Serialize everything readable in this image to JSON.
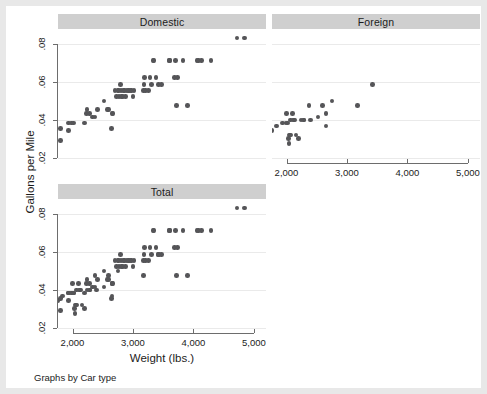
{
  "figure": {
    "background": "#e8e8e8",
    "canvas_color": "#ffffff",
    "strip_color": "#cfcfcf",
    "marker_color": "#555558",
    "grid_color": "#eaeaea",
    "axis_color": "#6d6d6d",
    "note": "Graphs by Car type",
    "ytitle": "Gallons per Mile",
    "xtitle": "Weight (lbs.)"
  },
  "chart_data": {
    "type": "scatter",
    "title": "",
    "xlabel": "Weight (lbs.)",
    "ylabel": "Gallons per Mile",
    "xlim": [
      1760,
      5200
    ],
    "ylim": [
      0.018,
      0.088
    ],
    "xticks": [
      2000,
      3000,
      4000,
      5000
    ],
    "xticklabels": [
      "2,000",
      "3,000",
      "4,000",
      "5,000"
    ],
    "yticks": [
      0.02,
      0.04,
      0.06,
      0.08
    ],
    "yticklabels": [
      ".02",
      ".04",
      ".06",
      ".08"
    ],
    "grid": "horizontal",
    "legend": "none",
    "by_variable": "Car type",
    "panels": [
      {
        "name": "domestic",
        "label": "Domestic",
        "show_xaxis": false,
        "show_yaxis": true,
        "points": [
          [
            1800,
            0.0357
          ],
          [
            1800,
            0.0294
          ],
          [
            1930,
            0.0345
          ],
          [
            1930,
            0.0385
          ],
          [
            1980,
            0.0385
          ],
          [
            2020,
            0.0385
          ],
          [
            2200,
            0.0385
          ],
          [
            2230,
            0.0435
          ],
          [
            2240,
            0.0455
          ],
          [
            2280,
            0.0435
          ],
          [
            2330,
            0.0417
          ],
          [
            2370,
            0.0417
          ],
          [
            2410,
            0.0455
          ],
          [
            2520,
            0.05
          ],
          [
            2580,
            0.0455
          ],
          [
            2600,
            0.0455
          ],
          [
            2640,
            0.0357
          ],
          [
            2650,
            0.0435
          ],
          [
            2670,
            0.0435
          ],
          [
            2700,
            0.0556
          ],
          [
            2730,
            0.0526
          ],
          [
            2750,
            0.0556
          ],
          [
            2760,
            0.0556
          ],
          [
            2770,
            0.0526
          ],
          [
            2790,
            0.0588
          ],
          [
            2800,
            0.0556
          ],
          [
            2810,
            0.0526
          ],
          [
            2830,
            0.0526
          ],
          [
            2840,
            0.0556
          ],
          [
            2860,
            0.0556
          ],
          [
            2880,
            0.0526
          ],
          [
            2900,
            0.0556
          ],
          [
            2930,
            0.0556
          ],
          [
            2950,
            0.0556
          ],
          [
            2980,
            0.0556
          ],
          [
            3000,
            0.0526
          ],
          [
            3020,
            0.0556
          ],
          [
            3170,
            0.0556
          ],
          [
            3180,
            0.0588
          ],
          [
            3190,
            0.0625
          ],
          [
            3210,
            0.0556
          ],
          [
            3260,
            0.0556
          ],
          [
            3280,
            0.0625
          ],
          [
            3310,
            0.0588
          ],
          [
            3330,
            0.0714
          ],
          [
            3350,
            0.0714
          ],
          [
            3380,
            0.0625
          ],
          [
            3420,
            0.0588
          ],
          [
            3470,
            0.0588
          ],
          [
            3600,
            0.0714
          ],
          [
            3600,
            0.0714
          ],
          [
            3690,
            0.0625
          ],
          [
            3700,
            0.0714
          ],
          [
            3720,
            0.0476
          ],
          [
            3740,
            0.0625
          ],
          [
            3830,
            0.0714
          ],
          [
            3900,
            0.0476
          ],
          [
            4060,
            0.0714
          ],
          [
            4080,
            0.0714
          ],
          [
            4130,
            0.0714
          ],
          [
            4290,
            0.0714
          ],
          [
            4720,
            0.0833
          ],
          [
            4840,
            0.0833
          ]
        ]
      },
      {
        "name": "foreign",
        "label": "Foreign",
        "show_xaxis": true,
        "show_yaxis": false,
        "points": [
          [
            1760,
            0.0345
          ],
          [
            1830,
            0.037
          ],
          [
            1930,
            0.0385
          ],
          [
            1990,
            0.0385
          ],
          [
            2000,
            0.0435
          ],
          [
            2020,
            0.0385
          ],
          [
            2030,
            0.0303
          ],
          [
            2040,
            0.0278
          ],
          [
            2050,
            0.0323
          ],
          [
            2070,
            0.0323
          ],
          [
            2070,
            0.04
          ],
          [
            2100,
            0.0435
          ],
          [
            2120,
            0.04
          ],
          [
            2130,
            0.04
          ],
          [
            2160,
            0.0323
          ],
          [
            2200,
            0.0303
          ],
          [
            2240,
            0.04
          ],
          [
            2280,
            0.04
          ],
          [
            2290,
            0.04
          ],
          [
            2370,
            0.0476
          ],
          [
            2400,
            0.04
          ],
          [
            2520,
            0.0417
          ],
          [
            2600,
            0.0476
          ],
          [
            2650,
            0.037
          ],
          [
            2650,
            0.0435
          ],
          [
            2750,
            0.05
          ],
          [
            3170,
            0.0476
          ],
          [
            3420,
            0.0588
          ]
        ]
      },
      {
        "name": "total",
        "label": "Total",
        "show_xaxis": true,
        "show_yaxis": true,
        "points": [
          [
            1760,
            0.0345
          ],
          [
            1800,
            0.0357
          ],
          [
            1800,
            0.0294
          ],
          [
            1830,
            0.037
          ],
          [
            1930,
            0.0345
          ],
          [
            1930,
            0.0385
          ],
          [
            1930,
            0.0385
          ],
          [
            1980,
            0.0385
          ],
          [
            1990,
            0.0385
          ],
          [
            2000,
            0.0435
          ],
          [
            2020,
            0.0385
          ],
          [
            2020,
            0.0385
          ],
          [
            2030,
            0.0303
          ],
          [
            2040,
            0.0278
          ],
          [
            2050,
            0.0323
          ],
          [
            2070,
            0.0323
          ],
          [
            2070,
            0.04
          ],
          [
            2100,
            0.0435
          ],
          [
            2120,
            0.04
          ],
          [
            2130,
            0.04
          ],
          [
            2160,
            0.0323
          ],
          [
            2200,
            0.0385
          ],
          [
            2200,
            0.0303
          ],
          [
            2230,
            0.0435
          ],
          [
            2240,
            0.0455
          ],
          [
            2240,
            0.04
          ],
          [
            2280,
            0.0435
          ],
          [
            2280,
            0.04
          ],
          [
            2290,
            0.04
          ],
          [
            2330,
            0.0417
          ],
          [
            2370,
            0.0417
          ],
          [
            2370,
            0.0476
          ],
          [
            2400,
            0.04
          ],
          [
            2410,
            0.0455
          ],
          [
            2520,
            0.05
          ],
          [
            2520,
            0.0417
          ],
          [
            2580,
            0.0455
          ],
          [
            2600,
            0.0455
          ],
          [
            2600,
            0.0476
          ],
          [
            2640,
            0.0357
          ],
          [
            2650,
            0.0435
          ],
          [
            2650,
            0.037
          ],
          [
            2650,
            0.0435
          ],
          [
            2670,
            0.0435
          ],
          [
            2700,
            0.0556
          ],
          [
            2730,
            0.0526
          ],
          [
            2750,
            0.0556
          ],
          [
            2750,
            0.05
          ],
          [
            2760,
            0.0556
          ],
          [
            2770,
            0.0526
          ],
          [
            2790,
            0.0588
          ],
          [
            2800,
            0.0556
          ],
          [
            2810,
            0.0526
          ],
          [
            2830,
            0.0526
          ],
          [
            2840,
            0.0556
          ],
          [
            2860,
            0.0556
          ],
          [
            2880,
            0.0526
          ],
          [
            2900,
            0.0556
          ],
          [
            2930,
            0.0556
          ],
          [
            2950,
            0.0556
          ],
          [
            2980,
            0.0556
          ],
          [
            3000,
            0.0526
          ],
          [
            3020,
            0.0556
          ],
          [
            3170,
            0.0556
          ],
          [
            3170,
            0.0476
          ],
          [
            3180,
            0.0588
          ],
          [
            3190,
            0.0625
          ],
          [
            3210,
            0.0556
          ],
          [
            3260,
            0.0556
          ],
          [
            3280,
            0.0625
          ],
          [
            3310,
            0.0588
          ],
          [
            3330,
            0.0714
          ],
          [
            3350,
            0.0714
          ],
          [
            3380,
            0.0625
          ],
          [
            3420,
            0.0588
          ],
          [
            3420,
            0.0588
          ],
          [
            3470,
            0.0588
          ],
          [
            3600,
            0.0714
          ],
          [
            3600,
            0.0714
          ],
          [
            3690,
            0.0625
          ],
          [
            3700,
            0.0714
          ],
          [
            3720,
            0.0476
          ],
          [
            3740,
            0.0625
          ],
          [
            3830,
            0.0714
          ],
          [
            3900,
            0.0476
          ],
          [
            4060,
            0.0714
          ],
          [
            4080,
            0.0714
          ],
          [
            4130,
            0.0714
          ],
          [
            4290,
            0.0714
          ],
          [
            4720,
            0.0833
          ],
          [
            4840,
            0.0833
          ]
        ]
      }
    ]
  }
}
